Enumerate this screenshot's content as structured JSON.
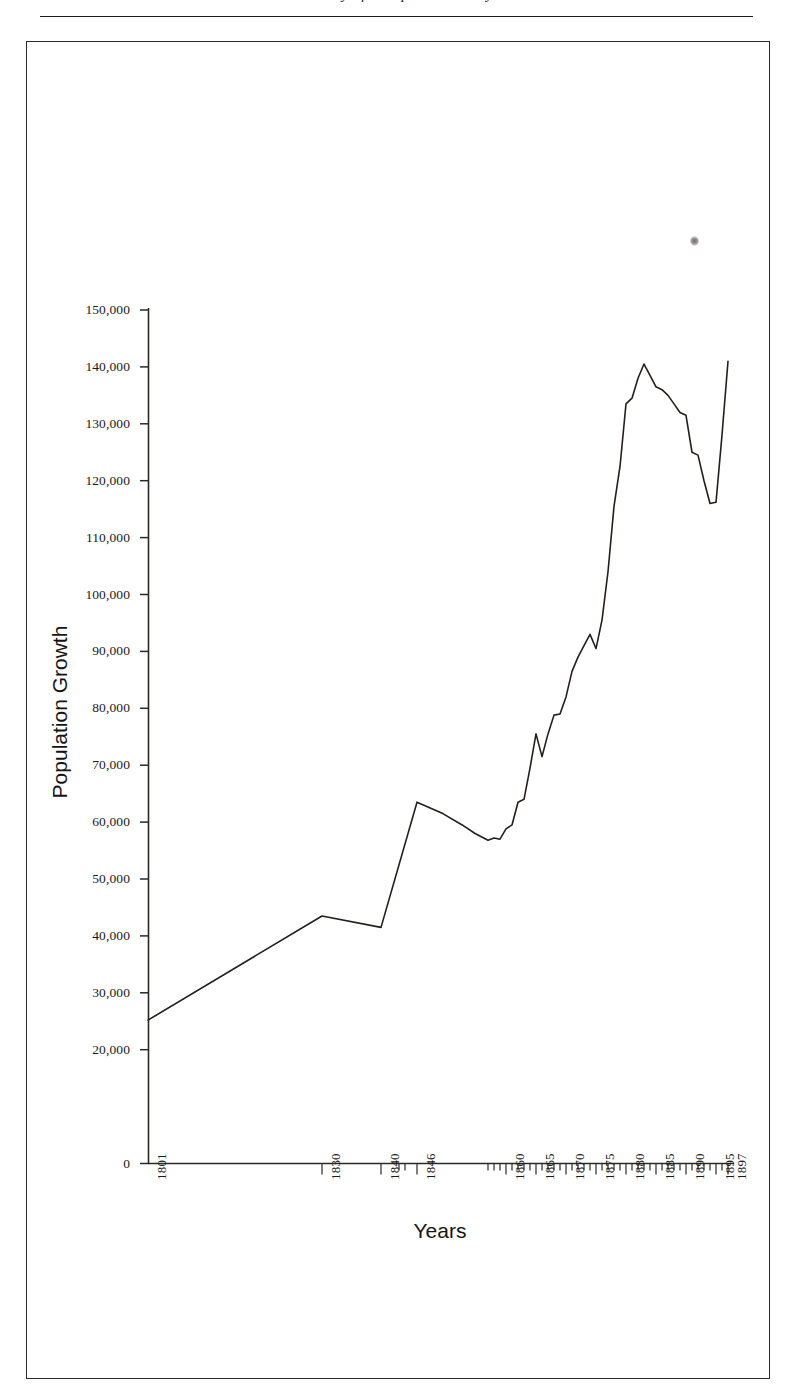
{
  "page": {
    "header_text": "Society of Hampshire County",
    "frame": {
      "left": 26,
      "top": 41,
      "width": 744,
      "height": 1338
    }
  },
  "chart_data": {
    "type": "line",
    "title": "",
    "xlabel": "Years",
    "ylabel": "Population Growth",
    "ylim": [
      0,
      150000
    ],
    "ytick_labels": [
      "150,000",
      "140,000",
      "130,000",
      "120,000",
      "110,000",
      "100,000",
      "90,000",
      "80,000",
      "70,000",
      "60,000",
      "50,000",
      "40,000",
      "30,000",
      "20,000",
      "0"
    ],
    "ytick_values": [
      150000,
      140000,
      130000,
      120000,
      110000,
      100000,
      90000,
      80000,
      70000,
      60000,
      50000,
      40000,
      30000,
      20000,
      0
    ],
    "xtick_labels": [
      "1801",
      "1830",
      "1840",
      "1846",
      "1860",
      "1865",
      "1870",
      "1875",
      "1880",
      "1885",
      "1890",
      "1895",
      "1897"
    ],
    "xtick_values": [
      1801,
      1830,
      1840,
      1846,
      1860,
      1865,
      1870,
      1875,
      1880,
      1885,
      1890,
      1895,
      1897
    ],
    "grid": false,
    "legend": "none",
    "line_color": "#231f1d",
    "x": [
      1801,
      1830,
      1840,
      1846,
      1850,
      1853,
      1855,
      1857,
      1858,
      1859,
      1860,
      1861,
      1862,
      1863,
      1864,
      1865,
      1866,
      1867,
      1868,
      1869,
      1870,
      1871,
      1872,
      1873,
      1874,
      1875,
      1876,
      1877,
      1878,
      1879,
      1880,
      1881,
      1882,
      1883,
      1884,
      1885,
      1886,
      1887,
      1888,
      1889,
      1890,
      1891,
      1892,
      1893,
      1894,
      1895,
      1896,
      1897
    ],
    "y": [
      25200,
      43500,
      41500,
      63500,
      61500,
      59500,
      58000,
      56800,
      57200,
      57000,
      58800,
      59500,
      63500,
      64000,
      69500,
      75500,
      71500,
      75500,
      78800,
      79000,
      82000,
      86500,
      89000,
      91000,
      93000,
      90500,
      95500,
      104000,
      115500,
      122500,
      133500,
      134500,
      138000,
      140500,
      138500,
      136500,
      136000,
      135000,
      133500,
      132000,
      131500,
      125000,
      124500,
      120000,
      116000,
      116200,
      128000,
      141000
    ]
  }
}
